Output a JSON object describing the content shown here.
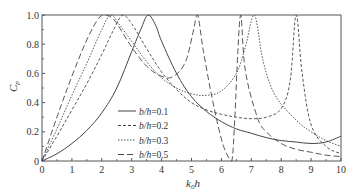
{
  "chart_data": {
    "type": "line",
    "title": "",
    "xlabel": "k0h",
    "xlabel_main": "k",
    "xlabel_sub": "0",
    "xlabel_tail": "h",
    "ylabel": "Cp",
    "ylabel_main": "C",
    "ylabel_sub": "p",
    "xlim": [
      0,
      10
    ],
    "ylim": [
      0,
      1.0
    ],
    "xticks": [
      "0",
      "1",
      "2",
      "3",
      "4",
      "5",
      "6",
      "7",
      "8",
      "9",
      "10"
    ],
    "yticks": [
      "0",
      "0.2",
      "0.4",
      "0.6",
      "0.8",
      "1.0"
    ],
    "grid": false,
    "legend_position": "center-left",
    "series": [
      {
        "name": "b/h=0.1",
        "label_lhs": "b/h",
        "label_rhs": "=0.1",
        "style": "solid",
        "x": [
          0,
          0.5,
          1,
          1.5,
          2,
          2.5,
          3,
          3.3,
          3.55,
          3.8,
          4,
          4.5,
          5,
          5.5,
          6,
          6.5,
          7,
          7.5,
          8,
          8.5,
          9,
          9.5,
          10
        ],
        "values": [
          0,
          0.05,
          0.12,
          0.21,
          0.33,
          0.5,
          0.75,
          0.9,
          1.0,
          0.93,
          0.82,
          0.6,
          0.44,
          0.34,
          0.27,
          0.22,
          0.19,
          0.16,
          0.14,
          0.13,
          0.12,
          0.13,
          0.17
        ]
      },
      {
        "name": "b/h=0.2",
        "label_lhs": "b/h",
        "label_rhs": "=0.2",
        "style": "dashed",
        "x": [
          0,
          0.5,
          1,
          1.5,
          2,
          2.4,
          2.7,
          3,
          3.5,
          4,
          4.5,
          5,
          5.5,
          6,
          6.5,
          7,
          7.5,
          8,
          8.3,
          8.5,
          8.7,
          9,
          9.5,
          10
        ],
        "values": [
          0,
          0.17,
          0.35,
          0.53,
          0.73,
          0.9,
          1.0,
          0.94,
          0.77,
          0.61,
          0.49,
          0.4,
          0.35,
          0.32,
          0.3,
          0.29,
          0.3,
          0.36,
          0.55,
          1.0,
          0.6,
          0.25,
          0.1,
          0.05
        ]
      },
      {
        "name": "b/h=0.3",
        "label_lhs": "b/h",
        "label_rhs": "=0.3",
        "style": "dotted",
        "x": [
          0,
          0.5,
          1,
          1.5,
          2,
          2.3,
          2.6,
          3,
          3.5,
          4,
          4.5,
          5,
          5.5,
          6,
          6.5,
          6.8,
          7.1,
          7.4,
          7.8,
          8.5,
          9,
          9.5,
          10
        ],
        "values": [
          0,
          0.22,
          0.45,
          0.67,
          0.9,
          1.0,
          0.93,
          0.82,
          0.68,
          0.57,
          0.5,
          0.46,
          0.45,
          0.48,
          0.6,
          0.78,
          1.0,
          0.68,
          0.45,
          0.28,
          0.2,
          0.14,
          0.1
        ]
      },
      {
        "name": "b/h=0.5",
        "label_lhs": "b/h",
        "label_rhs": "=0.5",
        "style": "longdash",
        "x": [
          0,
          0.5,
          1,
          1.5,
          1.9,
          2.1,
          2.4,
          3,
          3.5,
          4,
          4.4,
          4.8,
          5.05,
          5.2,
          5.4,
          5.7,
          6,
          6.2,
          6.35,
          6.45,
          6.55,
          6.65,
          6.8,
          7.2,
          7.5,
          8,
          8.5,
          9,
          9.5,
          10
        ],
        "values": [
          0,
          0.3,
          0.58,
          0.83,
          0.98,
          1.0,
          0.97,
          0.78,
          0.65,
          0.58,
          0.58,
          0.68,
          0.88,
          1.0,
          0.75,
          0.42,
          0.15,
          0.04,
          0.0,
          0.3,
          0.75,
          1.0,
          0.62,
          0.3,
          0.2,
          0.12,
          0.08,
          0.06,
          0.04,
          0.03
        ]
      }
    ]
  }
}
